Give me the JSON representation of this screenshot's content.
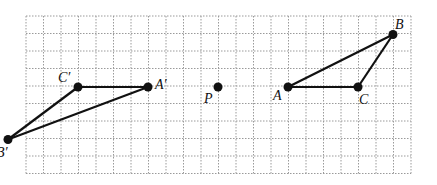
{
  "diagram": {
    "title": "",
    "grid": {
      "cols": 22,
      "rows": 9,
      "left": 26,
      "top": 16,
      "cell": 17.5
    },
    "points": [
      {
        "id": "A",
        "label": "A",
        "gx": 15,
        "gy": 4,
        "lx": -15,
        "ly": 13
      },
      {
        "id": "B",
        "label": "B",
        "gx": 21,
        "gy": 1,
        "lx": 2,
        "ly": -6
      },
      {
        "id": "C",
        "label": "C",
        "gx": 19,
        "gy": 4,
        "lx": 1,
        "ly": 17
      },
      {
        "id": "A'",
        "label": "A′",
        "gx": 7,
        "gy": 4,
        "lx": 7,
        "ly": 2
      },
      {
        "id": "B'",
        "label": "B′",
        "gx": -1,
        "gy": 7,
        "lx": 0,
        "ly": 0
      },
      {
        "id": "C'",
        "label": "C′",
        "gx": 3,
        "gy": 4,
        "lx": -20,
        "ly": -5
      },
      {
        "id": "P",
        "label": "P",
        "gx": 11,
        "gy": 4,
        "lx": -14,
        "ly": 16
      }
    ],
    "segments": [
      [
        "A",
        "B"
      ],
      [
        "B",
        "C"
      ],
      [
        "C",
        "A"
      ],
      [
        "A'",
        "B'"
      ],
      [
        "B'",
        "C'"
      ],
      [
        "C'",
        "A'"
      ]
    ]
  }
}
